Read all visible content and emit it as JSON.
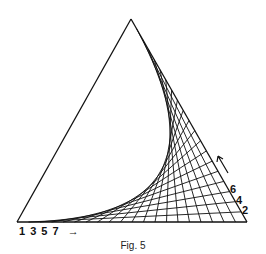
{
  "figure": {
    "caption": "Fig. 5",
    "triangle": {
      "apex": [
        131,
        19
      ],
      "bottom_left": [
        17,
        222
      ],
      "bottom_right": [
        247,
        222
      ]
    },
    "divisions": 20,
    "line_color": "#111111",
    "bottom_labels": {
      "text": "1 3 5 7",
      "arrow": "→"
    },
    "right_labels": [
      "6",
      "4",
      "2"
    ],
    "right_arrow": "↑"
  }
}
